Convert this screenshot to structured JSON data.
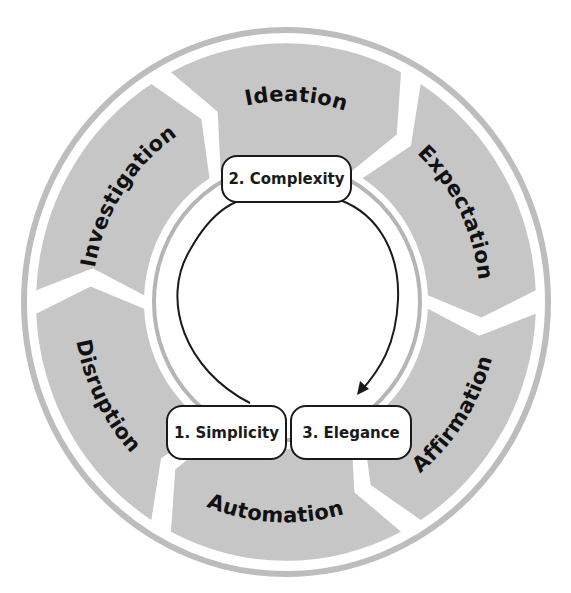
{
  "diagram": {
    "type": "cycle",
    "outer_cycle": {
      "direction": "clockwise",
      "segments": [
        {
          "label": "Ideation"
        },
        {
          "label": "Expectation"
        },
        {
          "label": "Affirmation"
        },
        {
          "label": "Automation"
        },
        {
          "label": "Disruption"
        },
        {
          "label": "Investigation"
        }
      ]
    },
    "inner_cycle": {
      "stages": [
        {
          "label": "1. Simplicity"
        },
        {
          "label": "2. Complexity"
        },
        {
          "label": "3. Elegance"
        }
      ],
      "arrow": "from 1. Simplicity to 2. Complexity to 3. Elegance"
    },
    "colors": {
      "segment_fill": "#c6c6c6",
      "ring_stroke": "#bdbdbd",
      "box_border": "#1a1a1a",
      "text": "#111111",
      "background": "#ffffff"
    }
  }
}
